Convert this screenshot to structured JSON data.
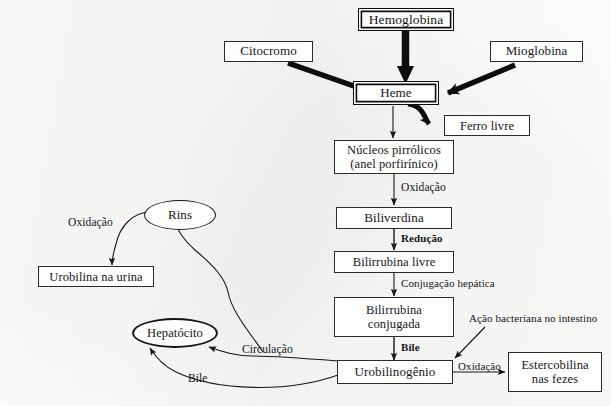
{
  "diagram": {
    "language": "pt-BR",
    "background_color": "#fbfbfa",
    "stroke_color": "#17171a",
    "nodes": [
      {
        "id": "hemoglobina",
        "label": "Hemoglobina",
        "shape": "box-double"
      },
      {
        "id": "citocromo",
        "label": "Citocromo",
        "shape": "box"
      },
      {
        "id": "mioglobina",
        "label": "Mioglobina",
        "shape": "box"
      },
      {
        "id": "heme",
        "label": "Heme",
        "shape": "box-double"
      },
      {
        "id": "ferro",
        "label": "Ferro livre",
        "shape": "box"
      },
      {
        "id": "nucleos",
        "label": "Núcleos pirrólicos",
        "label2": "(anel porfirínico)",
        "shape": "box"
      },
      {
        "id": "biliverdina",
        "label": "Biliverdina",
        "shape": "box"
      },
      {
        "id": "bilirrubina",
        "label": "Bilirrubina livre",
        "shape": "box"
      },
      {
        "id": "conjugada",
        "label": "Bilirrubina",
        "label2": "conjugada",
        "shape": "box"
      },
      {
        "id": "urobilinogenio",
        "label": "Urobilinogênio",
        "shape": "box"
      },
      {
        "id": "estercobilina",
        "label": "Estercobilina",
        "label2": "nas fezes",
        "shape": "box"
      },
      {
        "id": "rins",
        "label": "Rins",
        "shape": "ellipse"
      },
      {
        "id": "urobilina",
        "label": "Urobilina na urina",
        "shape": "box"
      },
      {
        "id": "hepatocito",
        "label": "Hepatócito",
        "shape": "ellipse"
      }
    ],
    "edge_labels": [
      {
        "id": "ox-nucleos",
        "text": "Oxidação",
        "bold": false
      },
      {
        "id": "reducao",
        "text": "Redução",
        "bold": true
      },
      {
        "id": "conjugacao",
        "text": "Conjugação hepática",
        "bold": false
      },
      {
        "id": "bile-centro",
        "text": "Bile",
        "bold": true
      },
      {
        "id": "ox-ester",
        "text": "Oxidação",
        "bold": false
      },
      {
        "id": "acao-bact",
        "text": "Ação bacteriana no intestino",
        "bold": false
      },
      {
        "id": "circulacao",
        "text": "Circulação",
        "bold": false
      },
      {
        "id": "bile-hep",
        "text": "Bile",
        "bold": false
      },
      {
        "id": "ox-rins",
        "text": "Oxidação",
        "bold": false
      }
    ]
  }
}
